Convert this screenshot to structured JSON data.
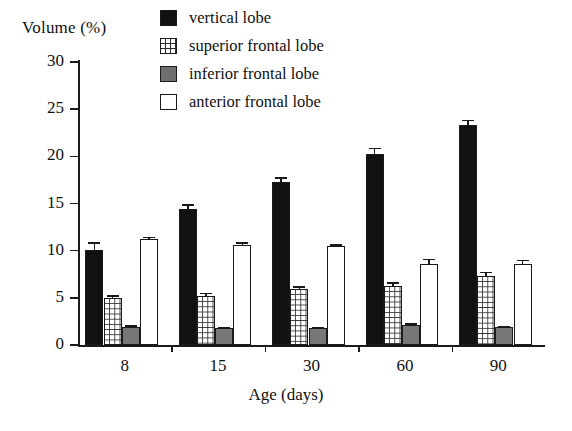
{
  "chart_data": {
    "type": "bar",
    "title": "",
    "subtitle": "",
    "xlabel": "Age (days)",
    "ylabel": "Volume (%)",
    "categories": [
      "8",
      "15",
      "30",
      "60",
      "90"
    ],
    "xlim_categories": 5,
    "ylim": [
      0,
      30
    ],
    "yticks": [
      0,
      5,
      10,
      15,
      20,
      25,
      30
    ],
    "grid": false,
    "legend_position": "top-center",
    "series": [
      {
        "name": "vertical lobe",
        "swatch": "black",
        "color": "#111111",
        "values": [
          10.1,
          14.4,
          17.3,
          20.2,
          23.3
        ],
        "errors": [
          0.8,
          0.5,
          0.5,
          0.7,
          0.6
        ]
      },
      {
        "name": "superior frontal lobe",
        "swatch": "grid",
        "color": "#ffffff",
        "values": [
          5.0,
          5.2,
          5.9,
          6.3,
          7.3
        ],
        "errors": [
          0.25,
          0.35,
          0.35,
          0.35,
          0.45
        ]
      },
      {
        "name": "inferior frontal lobe",
        "swatch": "gray",
        "color": "#777777",
        "values": [
          1.9,
          1.8,
          1.8,
          2.1,
          1.9
        ],
        "errors": [
          0.2,
          0.12,
          0.12,
          0.2,
          0.15
        ]
      },
      {
        "name": "anterior frontal lobe",
        "swatch": "white",
        "color": "#ffffff",
        "values": [
          11.2,
          10.6,
          10.5,
          8.6,
          8.6
        ],
        "errors": [
          0.3,
          0.3,
          0.2,
          0.55,
          0.45
        ]
      }
    ]
  },
  "axes": {
    "y_title": "Volume (%)",
    "x_title": "Age (days)",
    "y_tick_labels": [
      "0",
      "5",
      "10",
      "15",
      "20",
      "25",
      "30"
    ],
    "x_tick_labels": [
      "8",
      "15",
      "30",
      "60",
      "90"
    ]
  },
  "legend": {
    "items": [
      {
        "label": "vertical lobe",
        "swatch": "black"
      },
      {
        "label": "superior frontal lobe",
        "swatch": "grid"
      },
      {
        "label": "inferior frontal lobe",
        "swatch": "gray"
      },
      {
        "label": "anterior frontal lobe",
        "swatch": "white"
      }
    ]
  },
  "colors": {
    "vertical_lobe": "#111111",
    "superior_frontal_lobe": "#ffffff",
    "inferior_frontal_lobe": "#777777",
    "anterior_frontal_lobe": "#ffffff",
    "axis": "#1a1a1a",
    "background": "#ffffff"
  }
}
